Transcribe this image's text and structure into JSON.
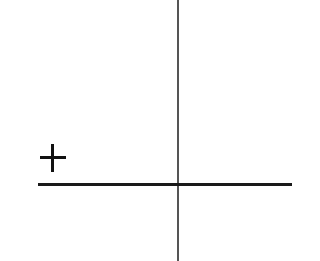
{
  "diagram": {
    "type": "axes-with-sign",
    "vertical_axis": {
      "color": "#555555"
    },
    "horizontal_axis": {
      "color": "#1a1a1a"
    },
    "sign": {
      "symbol": "+",
      "meaning": "plus-sign",
      "position": "upper-left above horizontal axis"
    }
  }
}
